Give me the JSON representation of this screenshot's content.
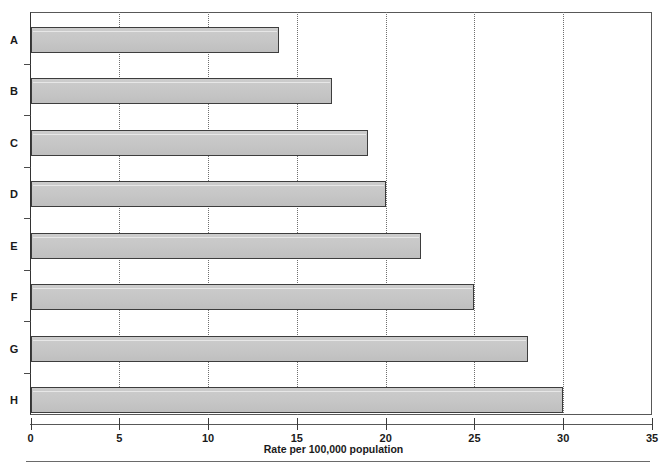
{
  "chart_data": {
    "type": "bar",
    "orientation": "horizontal",
    "title": "",
    "subtitle": "",
    "xlabel": "Rate per 100,000 population",
    "ylabel": "",
    "categories": [
      "A",
      "B",
      "C",
      "D",
      "E",
      "F",
      "G",
      "H"
    ],
    "values": [
      14,
      17,
      19,
      20,
      22,
      25,
      28,
      30
    ],
    "series": [
      {
        "name": "Rate",
        "values": [
          14,
          17,
          19,
          20,
          22,
          25,
          28,
          30
        ]
      }
    ],
    "xlim": [
      0,
      35
    ],
    "xticks": [
      0,
      5,
      10,
      15,
      20,
      25,
      30,
      35
    ],
    "xtick_labels": [
      "0",
      "5",
      "10",
      "15",
      "20",
      "25",
      "30",
      "35"
    ],
    "grid": "vertical-dotted",
    "legend": "none",
    "annotations": [],
    "colors": {
      "bar_fill": "#c8c8c8",
      "bar_border": "#3d3d3d",
      "gridline": "#6f6f6f",
      "axis": "#585858",
      "text": "#1a1a1a"
    }
  }
}
